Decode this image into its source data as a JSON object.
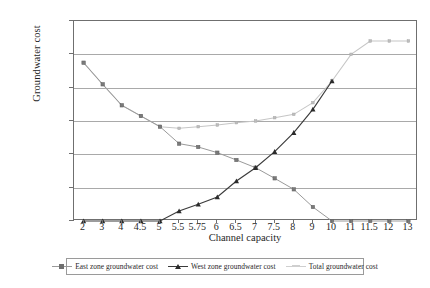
{
  "chart_data": {
    "type": "line",
    "title": "",
    "xlabel": "Channel capacity",
    "ylabel": "Groundwater cost",
    "categories": [
      "2",
      "3",
      "4",
      "4.5",
      "5",
      "5.5",
      "5.75",
      "6",
      "6.5",
      "7",
      "7.5",
      "8",
      "9",
      "10",
      "11",
      "11.5",
      "12",
      "13"
    ],
    "ylim": [
      0,
      600000
    ],
    "ytick_labels": [
      "0",
      "100000",
      "200000",
      "300000",
      "400000",
      "500000",
      "600000"
    ],
    "ytick_values": [
      0,
      100000,
      200000,
      300000,
      400000,
      500000,
      600000
    ],
    "ytick_step": 100000,
    "grid": "horizontal",
    "legend_position": "bottom",
    "series": [
      {
        "name": "East zone groundwater cost",
        "marker": "square",
        "color": "#9a9a9a",
        "values": [
          475000,
          410000,
          347000,
          315000,
          283000,
          232000,
          222000,
          205000,
          183000,
          160000,
          128000,
          95000,
          42000,
          0,
          0,
          0,
          0,
          0
        ]
      },
      {
        "name": "West zone groundwater cost",
        "marker": "triangle",
        "color": "#3b3b3b",
        "values": [
          0,
          0,
          0,
          0,
          0,
          30000,
          50000,
          72000,
          120000,
          160000,
          208000,
          265000,
          335000,
          420000,
          null,
          null,
          null,
          null
        ]
      },
      {
        "name": "Total groundwater cost",
        "marker": "square",
        "color": "#c6c6c6",
        "values": [
          475000,
          410000,
          347000,
          315000,
          283000,
          278000,
          283000,
          288000,
          295000,
          300000,
          310000,
          320000,
          355000,
          420000,
          500000,
          540000,
          540000,
          540000
        ]
      }
    ]
  },
  "axes": {
    "y_title": "Groundwater cost",
    "x_title": "Channel capacity"
  },
  "legend": {
    "items": [
      {
        "label": "East zone groundwater cost",
        "marker": "square-marker-icon"
      },
      {
        "label": "West zone groundwater cost",
        "marker": "triangle-marker-icon"
      },
      {
        "label": "Total groundwater cost",
        "marker": "line-marker-icon"
      }
    ]
  }
}
